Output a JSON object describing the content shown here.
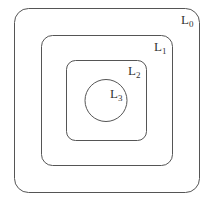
{
  "diagram": {
    "regions": [
      {
        "name": "L",
        "sub": "0",
        "shape": "rounded-square"
      },
      {
        "name": "L",
        "sub": "1",
        "shape": "rounded-square"
      },
      {
        "name": "L",
        "sub": "2",
        "shape": "rounded-square"
      },
      {
        "name": "L",
        "sub": "3",
        "shape": "circle"
      }
    ]
  }
}
